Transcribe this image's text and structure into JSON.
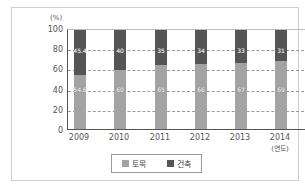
{
  "chart_data": {
    "type": "bar",
    "stacked": true,
    "title": "",
    "xlabel": "(연도)",
    "ylabel": "(%)",
    "ylim": [
      0,
      100
    ],
    "yticks": [
      0,
      20,
      40,
      60,
      80,
      100
    ],
    "grid": true,
    "legend_position": "bottom",
    "values_estimated": true,
    "estimate_note": "Label digits illegible at source resolution; values estimated from bar geometry, approx. ±2 points.",
    "categories": [
      "2009",
      "2010",
      "2011",
      "2012",
      "2013",
      "2014"
    ],
    "series": [
      {
        "name": "토목",
        "color": "#a3a3a3",
        "values": [
          54.6,
          60,
          65,
          66,
          67,
          69
        ]
      },
      {
        "name": "건축",
        "color": "#555555",
        "values": [
          45.4,
          40,
          35,
          34,
          33,
          31
        ]
      }
    ]
  },
  "labels": {
    "unit": "(%)",
    "xunit": "(연도)",
    "yticks": [
      "0",
      "20",
      "40",
      "60",
      "80",
      "100"
    ],
    "bars": [
      {
        "year": "2009",
        "civil": "54.6",
        "arch": "45.4"
      },
      {
        "year": "2010",
        "civil": "60",
        "arch": "40"
      },
      {
        "year": "2011",
        "civil": "65",
        "arch": "35"
      },
      {
        "year": "2012",
        "civil": "66",
        "arch": "34"
      },
      {
        "year": "2013",
        "civil": "67",
        "arch": "33"
      },
      {
        "year": "2014",
        "civil": "69",
        "arch": "31"
      }
    ],
    "legend": {
      "civil": "토목",
      "arch": "건축"
    }
  }
}
